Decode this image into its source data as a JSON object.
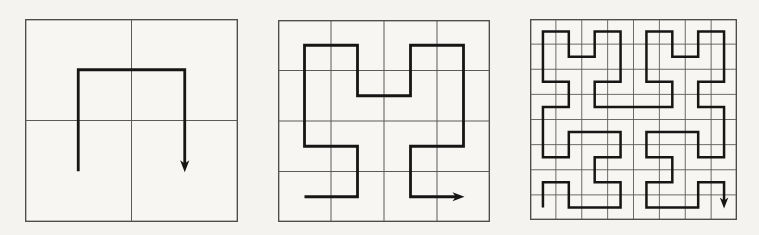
{
  "figure": {
    "colors": {
      "page_background": "#f4f3ef",
      "panel_fill": "#f7f6f2",
      "grid_line": "#5b5b5b",
      "panel_border": "#454545",
      "curve": "#161616"
    },
    "panels": [
      {
        "name": "hilbert-curve-order-1",
        "order": 1,
        "grid_divisions": 2,
        "px_width": 213,
        "px_height": 203,
        "border_stroke": 1.3,
        "grid_stroke": 1.0,
        "curve_stroke": 2.8,
        "arrow": {
          "length": 11,
          "half_width": 4.6,
          "notch": 3.2,
          "line_shorten": 7,
          "tip_overshoot": 1
        },
        "start_cell": [
          0,
          1
        ],
        "end_cell": [
          1,
          1
        ],
        "arrow_direction": "down",
        "path_cells": [
          [
            0,
            1
          ],
          [
            0,
            0
          ],
          [
            1,
            0
          ],
          [
            1,
            1
          ]
        ]
      },
      {
        "name": "hilbert-curve-order-2",
        "order": 2,
        "grid_divisions": 4,
        "px_width": 212,
        "px_height": 202,
        "border_stroke": 1.3,
        "grid_stroke": 1.0,
        "curve_stroke": 2.8,
        "arrow": {
          "length": 11,
          "half_width": 4.6,
          "notch": 3.2,
          "line_shorten": 7,
          "tip_overshoot": 1
        },
        "start_cell": [
          0,
          3
        ],
        "end_cell": [
          3,
          3
        ],
        "arrow_direction": "right",
        "path_cells": [
          [
            0,
            3
          ],
          [
            1,
            3
          ],
          [
            1,
            2
          ],
          [
            0,
            2
          ],
          [
            0,
            1
          ],
          [
            0,
            0
          ],
          [
            1,
            0
          ],
          [
            1,
            1
          ],
          [
            2,
            1
          ],
          [
            2,
            0
          ],
          [
            3,
            0
          ],
          [
            3,
            1
          ],
          [
            3,
            2
          ],
          [
            2,
            2
          ],
          [
            2,
            3
          ],
          [
            3,
            3
          ]
        ]
      },
      {
        "name": "hilbert-curve-order-3",
        "order": 3,
        "grid_divisions": 8,
        "px_width": 207,
        "px_height": 201,
        "border_stroke": 1.3,
        "grid_stroke": 0.9,
        "curve_stroke": 2.5,
        "arrow": {
          "length": 10,
          "half_width": 4.2,
          "notch": 3.0,
          "line_shorten": 6,
          "tip_overshoot": 1
        },
        "start_cell": [
          0,
          7
        ],
        "end_cell": [
          7,
          7
        ],
        "arrow_direction": "down",
        "path_cells": [
          [
            0,
            7
          ],
          [
            0,
            6
          ],
          [
            1,
            6
          ],
          [
            1,
            7
          ],
          [
            2,
            7
          ],
          [
            3,
            7
          ],
          [
            3,
            6
          ],
          [
            2,
            6
          ],
          [
            2,
            5
          ],
          [
            3,
            5
          ],
          [
            3,
            4
          ],
          [
            2,
            4
          ],
          [
            1,
            4
          ],
          [
            1,
            5
          ],
          [
            0,
            5
          ],
          [
            0,
            4
          ],
          [
            0,
            3
          ],
          [
            1,
            3
          ],
          [
            1,
            2
          ],
          [
            0,
            2
          ],
          [
            0,
            1
          ],
          [
            0,
            0
          ],
          [
            1,
            0
          ],
          [
            1,
            1
          ],
          [
            2,
            1
          ],
          [
            2,
            0
          ],
          [
            3,
            0
          ],
          [
            3,
            1
          ],
          [
            3,
            2
          ],
          [
            2,
            2
          ],
          [
            2,
            3
          ],
          [
            3,
            3
          ],
          [
            4,
            3
          ],
          [
            5,
            3
          ],
          [
            5,
            2
          ],
          [
            4,
            2
          ],
          [
            4,
            1
          ],
          [
            4,
            0
          ],
          [
            5,
            0
          ],
          [
            5,
            1
          ],
          [
            6,
            1
          ],
          [
            6,
            0
          ],
          [
            7,
            0
          ],
          [
            7,
            1
          ],
          [
            7,
            2
          ],
          [
            6,
            2
          ],
          [
            6,
            3
          ],
          [
            7,
            3
          ],
          [
            7,
            4
          ],
          [
            7,
            5
          ],
          [
            6,
            5
          ],
          [
            6,
            4
          ],
          [
            5,
            4
          ],
          [
            4,
            4
          ],
          [
            4,
            5
          ],
          [
            5,
            5
          ],
          [
            5,
            6
          ],
          [
            4,
            6
          ],
          [
            4,
            7
          ],
          [
            5,
            7
          ],
          [
            6,
            7
          ],
          [
            6,
            6
          ],
          [
            7,
            6
          ],
          [
            7,
            7
          ]
        ]
      }
    ]
  }
}
